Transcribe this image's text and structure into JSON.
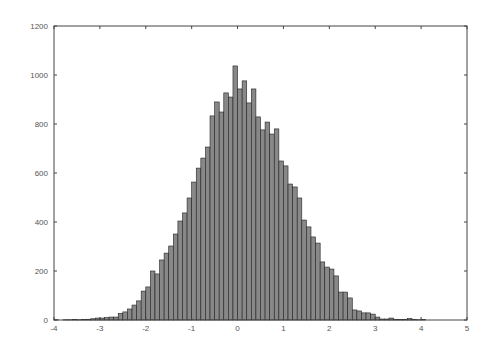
{
  "chart_data": {
    "type": "bar",
    "subtype": "histogram",
    "title": "",
    "xlabel": "",
    "ylabel": "",
    "xlim": [
      -4,
      5
    ],
    "ylim": [
      0,
      1200
    ],
    "grid": false,
    "legend": null,
    "bin_width": 0.1,
    "bin_start": -4.0,
    "x_ticks": [
      -4,
      -3,
      -2,
      -1,
      0,
      1,
      2,
      3,
      4,
      5
    ],
    "y_ticks": [
      0,
      200,
      400,
      600,
      800,
      1000,
      1200
    ],
    "bar_color": "#888888",
    "bar_edge_color": "#222222",
    "values": [
      1,
      0,
      1,
      1,
      2,
      1,
      2,
      3,
      5,
      8,
      8,
      10,
      12,
      12,
      27,
      33,
      45,
      61,
      78,
      118,
      135,
      200,
      188,
      245,
      273,
      302,
      351,
      404,
      437,
      498,
      563,
      620,
      661,
      706,
      833,
      890,
      849,
      927,
      910,
      1037,
      943,
      976,
      886,
      943,
      829,
      776,
      808,
      759,
      780,
      649,
      629,
      555,
      543,
      498,
      408,
      380,
      339,
      314,
      237,
      216,
      208,
      180,
      114,
      114,
      90,
      41,
      37,
      29,
      29,
      24,
      12,
      4,
      4,
      8,
      3,
      2,
      3,
      6,
      2,
      1,
      2,
      0,
      0,
      0,
      0,
      0,
      0,
      0,
      0,
      0
    ]
  }
}
